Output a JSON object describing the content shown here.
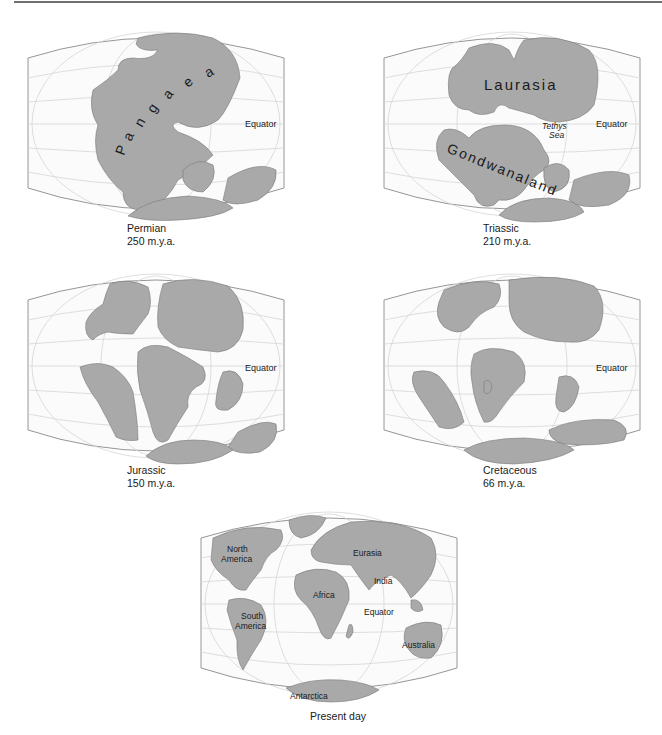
{
  "figure": {
    "panels": [
      {
        "id": "permian",
        "period": "Permian",
        "age": "250 m.y.a.",
        "labels": {
          "equator": "Equator",
          "supercontinent": "Pangaea"
        }
      },
      {
        "id": "triassic",
        "period": "Triassic",
        "age": "210 m.y.a.",
        "labels": {
          "equator": "Equator",
          "north": "Laurasia",
          "south": "Gondwanaland",
          "sea_1": "Tethys",
          "sea_2": "Sea"
        }
      },
      {
        "id": "jurassic",
        "period": "Jurassic",
        "age": "150 m.y.a.",
        "labels": {
          "equator": "Equator"
        }
      },
      {
        "id": "cretaceous",
        "period": "Cretaceous",
        "age": "66 m.y.a.",
        "labels": {
          "equator": "Equator"
        }
      },
      {
        "id": "present",
        "period": "Present day",
        "labels": {
          "equator": "Equator",
          "north_america_1": "North",
          "north_america_2": "America",
          "south_america_1": "South",
          "south_america_2": "America",
          "eurasia": "Eurasia",
          "africa": "Africa",
          "india": "India",
          "australia": "Australia",
          "antarctica": "Antarctica"
        }
      }
    ],
    "colors": {
      "land": "#a9a9a9",
      "land_stroke": "#7a7a7a",
      "ocean": "#fbfbfb",
      "graticule": "#d6d6d6",
      "frame": "#8a8a8a",
      "rule": "#6f6f6f"
    }
  }
}
